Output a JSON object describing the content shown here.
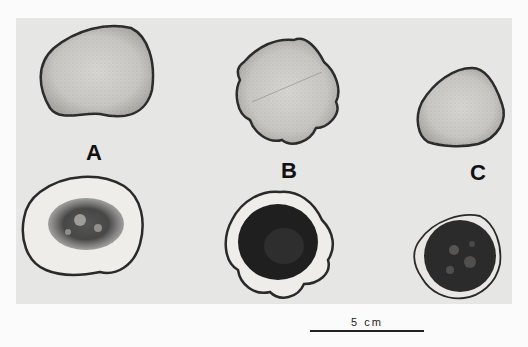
{
  "figure": {
    "background_color": "#e6e6e4",
    "page_color": "#fbfbfb",
    "panels": [
      {
        "label": "A",
        "top_description": "fresh cross-section, light radial texture",
        "bottom_description": "cross-section with dark mottled central staining"
      },
      {
        "label": "B",
        "top_description": "fresh cross-section, lobed outline, light radial texture",
        "bottom_description": "cross-section with solid dark central staining"
      },
      {
        "label": "C",
        "top_description": "fresh cross-section, small rounded-triangular outline",
        "bottom_description": "cross-section with dark speckled central staining"
      }
    ],
    "scale_bar": {
      "text": "5 cm"
    }
  }
}
